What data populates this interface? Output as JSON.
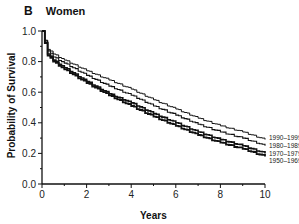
{
  "panel": {
    "letter": "B",
    "title": "Women"
  },
  "chart_data": {
    "type": "line",
    "title": "Women",
    "panel_label": "B",
    "xlabel": "Years",
    "ylabel": "Probability of Survival",
    "xlim": [
      0,
      10
    ],
    "ylim": [
      0.0,
      1.0
    ],
    "xticks": [
      0,
      2,
      4,
      6,
      8,
      10
    ],
    "yticks": [
      "0.0",
      "0.2",
      "0.4",
      "0.6",
      "0.8",
      "1.0"
    ],
    "grid": false,
    "legend_position": "right end of lines (direct labels)",
    "x": [
      0,
      0.25,
      0.5,
      1,
      2,
      3,
      4,
      5,
      6,
      7,
      8,
      9,
      10
    ],
    "series": [
      {
        "name": "1990–1999",
        "values": [
          1.0,
          0.88,
          0.85,
          0.81,
          0.74,
          0.68,
          0.62,
          0.55,
          0.49,
          0.43,
          0.38,
          0.34,
          0.29
        ]
      },
      {
        "name": "1980–1989",
        "values": [
          1.0,
          0.87,
          0.83,
          0.79,
          0.71,
          0.64,
          0.58,
          0.51,
          0.45,
          0.39,
          0.34,
          0.3,
          0.25
        ]
      },
      {
        "name": "1970–1979",
        "values": [
          1.0,
          0.85,
          0.81,
          0.76,
          0.67,
          0.59,
          0.53,
          0.46,
          0.4,
          0.34,
          0.29,
          0.25,
          0.2
        ]
      },
      {
        "name": "1950–1969",
        "values": [
          1.0,
          0.84,
          0.8,
          0.75,
          0.66,
          0.58,
          0.51,
          0.44,
          0.38,
          0.32,
          0.27,
          0.23,
          0.18
        ]
      }
    ]
  }
}
